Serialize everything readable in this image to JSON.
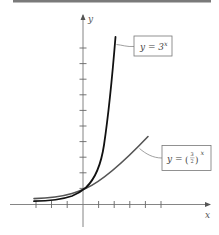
{
  "figure": {
    "top_rule_color": "#7a7a7a",
    "axes": {
      "x_label": "x",
      "y_label": "y",
      "color": "#6e6e6e",
      "origin_px": [
        83,
        204
      ],
      "unit_px": 15.6,
      "x_ticks": [
        -3,
        -2,
        -1,
        1,
        2,
        3,
        4,
        5
      ],
      "y_ticks": [
        1,
        2,
        3,
        4,
        5,
        6,
        7,
        8,
        9,
        10
      ]
    },
    "curves": [
      {
        "name": "three-to-the-x",
        "color": "#111111",
        "label_prefix": "y = 3",
        "label_exponent": "x",
        "label_full": "y = 3^x"
      },
      {
        "name": "three-halves-to-the-x",
        "color": "#555555",
        "label_prefix": "y = ",
        "label_frac_num": "3",
        "label_frac_den": "2",
        "label_exponent": "x",
        "label_full": "y = (3/2)^x"
      }
    ]
  }
}
